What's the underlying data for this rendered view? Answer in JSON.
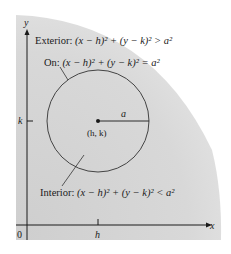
{
  "diagram": {
    "labels": {
      "y_axis": "y",
      "x_axis": "x",
      "origin": "0",
      "k_tick": "k",
      "h_tick": "h",
      "radius": "a",
      "center": "(h, k)"
    },
    "regions": {
      "exterior": {
        "prefix": "Exterior: ",
        "equation": "(x − h)² + (y − k)² > a²"
      },
      "on": {
        "prefix": "On: ",
        "equation": "(x − h)² + (y − k)² = a²"
      },
      "interior": {
        "prefix": "Interior: ",
        "equation": "(x − h)² + (y − k)² < a²"
      }
    },
    "colors": {
      "shading": "#d6d6d6",
      "ink": "#1a1a1a",
      "circle": "#444444"
    }
  }
}
